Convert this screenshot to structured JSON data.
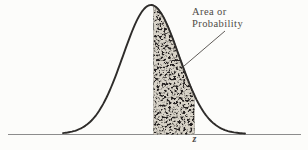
{
  "labels": {
    "area_line1": "Area or",
    "area_line2": "Probability",
    "axis_z": "z"
  },
  "colors": {
    "background": "#fcfcfa",
    "curve": "#2e2c2a",
    "axis": "#8c8c8c",
    "text": "#4e4a46",
    "shade": "#262422",
    "speckle": "#d8d3c8"
  },
  "diagram": {
    "type": "normal-curve-shaded-area",
    "canvas": {
      "width": 308,
      "height": 150
    },
    "baseline_y": 134,
    "axis": {
      "x_start": 8,
      "x_end": 301
    },
    "curve": {
      "mean_x": 151,
      "sigma": 28,
      "amplitude": 129,
      "x_start": 63,
      "x_end": 245
    },
    "shade": {
      "x_from": 154,
      "x_to": 194
    },
    "leader_line": {
      "x1": 225,
      "y1": 31,
      "x2": 184,
      "y2": 66
    }
  }
}
